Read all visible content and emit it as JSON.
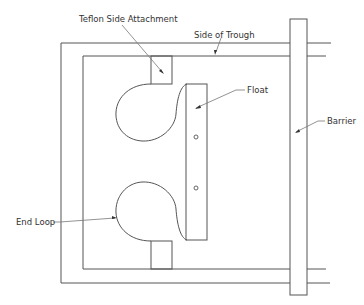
{
  "figure": {
    "type": "schematic-top-view"
  },
  "labels": {
    "teflon_side_attachment": "Teflon Side Attachment",
    "side_of_trough": "Side of Trough",
    "float": "Float",
    "barrier": "Barrier",
    "end_loop": "End Loop"
  },
  "colors": {
    "line": "#555555",
    "text": "#333333",
    "background": "#ffffff"
  }
}
